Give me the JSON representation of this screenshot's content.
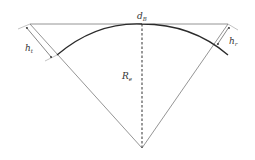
{
  "diagram": {
    "labels": {
      "top_chord": "d",
      "top_chord_sub": "B",
      "radius": "R",
      "radius_sub": "e",
      "left_height": "h",
      "left_height_sub": "t",
      "right_height": "h",
      "right_height_sub": "r"
    },
    "colors": {
      "lines": "#7a7a7a",
      "arc": "#2b2b2b",
      "dashed": "#444444",
      "text": "#333333"
    }
  }
}
